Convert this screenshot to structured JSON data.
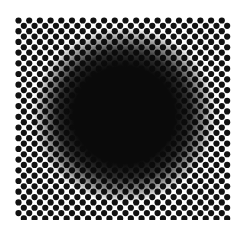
{
  "image": {
    "subject": "halftone dot grid optical illusion with a blurred dark circular blob in the center",
    "pattern": "staggered black dots on white background",
    "background_color": "#ffffff",
    "dot_color": "#111111",
    "blob_color": "#0a0a0a"
  }
}
